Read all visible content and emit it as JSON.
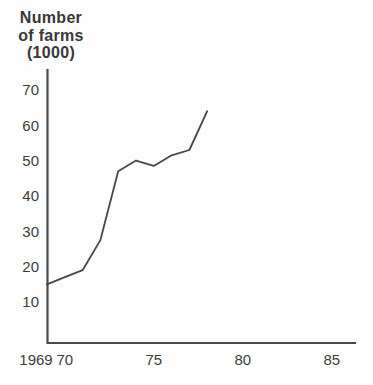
{
  "chart": {
    "title_lines": [
      "Number",
      "of farms",
      "(1000)"
    ],
    "colors": {
      "background": "#fdfdfd",
      "axis": "#4a4a4a",
      "line": "#474747",
      "text": "#3d3d3d",
      "title": "#383838"
    }
  },
  "y_axis": {
    "ticks": [
      {
        "label": "70",
        "value": 70
      },
      {
        "label": "60",
        "value": 60
      },
      {
        "label": "50",
        "value": 50
      },
      {
        "label": "40",
        "value": 40
      },
      {
        "label": "30",
        "value": 30
      },
      {
        "label": "20",
        "value": 20
      },
      {
        "label": "10",
        "value": 10
      }
    ]
  },
  "x_axis": {
    "ticks": [
      {
        "label": "1969",
        "year": 1969
      },
      {
        "label": "70",
        "year": 1970
      },
      {
        "label": "75",
        "year": 1975
      },
      {
        "label": "80",
        "year": 1980
      },
      {
        "label": "85",
        "year": 1985
      }
    ]
  },
  "chart_data": {
    "type": "line",
    "title": "Number of farms (1000)",
    "ylabel": "Number of farms (1000)",
    "xlabel": "",
    "x": [
      1969,
      1970,
      1971,
      1972,
      1973,
      1974,
      1975,
      1976,
      1977,
      1978
    ],
    "values": [
      15,
      17,
      19,
      27.5,
      47,
      50,
      48.5,
      51.5,
      53,
      64
    ],
    "series": [
      {
        "name": "Number of farms (1000)",
        "values": [
          15,
          17,
          19,
          27.5,
          47,
          50,
          48.5,
          51.5,
          53,
          64
        ]
      }
    ],
    "xlim": [
      1969,
      1986
    ],
    "ylim": [
      0,
      75
    ],
    "x_tick_labels": [
      "1969",
      "70",
      "75",
      "80",
      "85"
    ],
    "y_tick_values": [
      10,
      20,
      30,
      40,
      50,
      60,
      70
    ],
    "grid": false,
    "legend": false
  }
}
